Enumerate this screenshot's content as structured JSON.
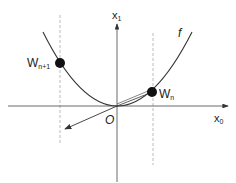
{
  "diagram": {
    "curve_label": "f",
    "axes": {
      "x_label": "x",
      "x_sub": "0",
      "y_label": "x",
      "y_sub": "1",
      "origin_label": "O"
    },
    "points": [
      {
        "label": "W",
        "sub": "n+1",
        "x": 60,
        "y": 63
      },
      {
        "label": "W",
        "sub": "n",
        "x": 152,
        "y": 92
      }
    ],
    "colors": {
      "line": "#333333",
      "dash": "#aaaaaa",
      "point": "#111111"
    }
  }
}
